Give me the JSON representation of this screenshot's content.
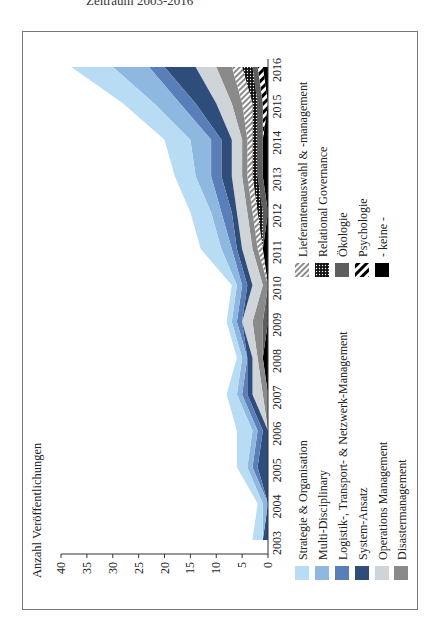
{
  "caption": "Zeitraum 2003-2016",
  "chart_data": {
    "type": "area",
    "stacked": true,
    "orientation": "rotated-90-ccw",
    "title": "",
    "xlabel": "",
    "ylabel": "Anzahl Veröffentlichungen",
    "ylim": [
      0,
      40
    ],
    "yticks": [
      0,
      5,
      10,
      15,
      20,
      25,
      30,
      35,
      40
    ],
    "categories": [
      "2003",
      "2004",
      "2005",
      "2006",
      "2007",
      "2008",
      "2009",
      "2010",
      "2011",
      "2012",
      "2013",
      "2014",
      "2015",
      "2016"
    ],
    "legend_position": "bottom (two columns)",
    "series": [
      {
        "name": "- keine -",
        "color": "#000000",
        "pattern": "solid",
        "values": [
          0,
          0,
          0,
          0,
          0,
          1,
          0,
          0,
          1,
          0,
          1,
          1,
          0,
          1
        ]
      },
      {
        "name": "Psychologie",
        "color": "#000000",
        "pattern": "stripes",
        "values": [
          0,
          0,
          0,
          0,
          0,
          0,
          0,
          0,
          0,
          0,
          0,
          0,
          1,
          1
        ]
      },
      {
        "name": "Ökologie",
        "color": "#5e5e5e",
        "pattern": "solid",
        "values": [
          0,
          0,
          0,
          0,
          0,
          0,
          1,
          0,
          0,
          1,
          1,
          1,
          1,
          1
        ]
      },
      {
        "name": "Relational Governance",
        "color": "#1a1a1a",
        "pattern": "dots",
        "values": [
          0,
          0,
          0,
          0,
          0,
          0,
          0,
          0,
          0,
          1,
          1,
          1,
          1,
          2
        ]
      },
      {
        "name": "Lieferantenauswahl & -management",
        "color": "#9a9a9a",
        "pattern": "hatch",
        "values": [
          0,
          0,
          0,
          0,
          0,
          0,
          0,
          0,
          1,
          1,
          1,
          1,
          2,
          2
        ]
      },
      {
        "name": "Disastermanagement",
        "color": "#8a8a8a",
        "pattern": "solid",
        "values": [
          0,
          0,
          0,
          0,
          1,
          1,
          2,
          1,
          1,
          1,
          1,
          1,
          2,
          3
        ]
      },
      {
        "name": "Operations Management",
        "color": "#cfd4d9",
        "pattern": "solid",
        "values": [
          0,
          0,
          0,
          0,
          2,
          1,
          2,
          2,
          2,
          2,
          2,
          2,
          3,
          4
        ]
      },
      {
        "name": "System-Ansatz",
        "color": "#2f4d7a",
        "pattern": "solid",
        "values": [
          1,
          0,
          2,
          1,
          1,
          1,
          0,
          1,
          1,
          1,
          2,
          2,
          4,
          6
        ]
      },
      {
        "name": "Logistik-, Transport- & Netzwerk-Management",
        "color": "#5a7fb8",
        "pattern": "solid",
        "values": [
          0,
          0,
          1,
          1,
          1,
          0,
          1,
          1,
          1,
          2,
          2,
          2,
          3,
          3
        ]
      },
      {
        "name": "Multi-Disciplinary",
        "color": "#8fb8e0",
        "pattern": "solid",
        "values": [
          0,
          1,
          1,
          1,
          1,
          1,
          1,
          1,
          2,
          2,
          3,
          4,
          5,
          7
        ]
      },
      {
        "name": "Strategie & Organisation",
        "color": "#b9dcf5",
        "pattern": "solid",
        "values": [
          2,
          1,
          2,
          3,
          2,
          1,
          1,
          1,
          4,
          4,
          4,
          5,
          6,
          8
        ]
      }
    ],
    "totals": [
      3,
      2,
      6,
      6,
      8,
      6,
      8,
      7,
      13,
      15,
      18,
      20,
      28,
      38
    ]
  },
  "legend": {
    "left_column": [
      {
        "label": "Strategie & Organisation",
        "color": "#b9dcf5",
        "pattern": "solid"
      },
      {
        "label": "Multi-Disciplinary",
        "color": "#8fb8e0",
        "pattern": "solid"
      },
      {
        "label": "Logistik-, Transport- & Netzwerk-Management",
        "color": "#5a7fb8",
        "pattern": "solid"
      },
      {
        "label": "System-Ansatz",
        "color": "#2f4d7a",
        "pattern": "solid"
      },
      {
        "label": "Operations Management",
        "color": "#cfd4d9",
        "pattern": "solid"
      },
      {
        "label": "Disastermanagement",
        "color": "#8a8a8a",
        "pattern": "solid"
      }
    ],
    "right_column": [
      {
        "label": "Lieferantenauswahl  & -management",
        "color": "#9a9a9a",
        "pattern": "hatch"
      },
      {
        "label": "Relational Governance",
        "color": "#1a1a1a",
        "pattern": "dots"
      },
      {
        "label": "Ökologie",
        "color": "#5e5e5e",
        "pattern": "solid"
      },
      {
        "label": "Psychologie",
        "color": "#000000",
        "pattern": "stripes"
      },
      {
        "label": "- keine -",
        "color": "#000000",
        "pattern": "solid"
      }
    ]
  }
}
